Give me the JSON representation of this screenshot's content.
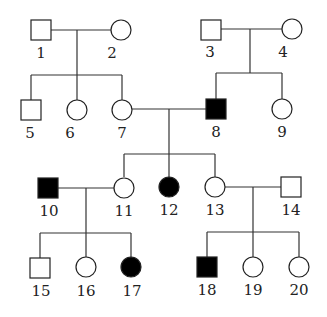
{
  "diagram": {
    "type": "pedigree",
    "colors": {
      "affected": "#000000",
      "unaffected": "#ffffff",
      "line": "#333333"
    },
    "individuals": [
      {
        "id": "1",
        "label": "1",
        "sex": "male",
        "affected": false,
        "generation": 1
      },
      {
        "id": "2",
        "label": "2",
        "sex": "female",
        "affected": false,
        "generation": 1
      },
      {
        "id": "3",
        "label": "3",
        "sex": "male",
        "affected": false,
        "generation": 1
      },
      {
        "id": "4",
        "label": "4",
        "sex": "female",
        "affected": false,
        "generation": 1
      },
      {
        "id": "5",
        "label": "5",
        "sex": "male",
        "affected": false,
        "generation": 2
      },
      {
        "id": "6",
        "label": "6",
        "sex": "female",
        "affected": false,
        "generation": 2
      },
      {
        "id": "7",
        "label": "7",
        "sex": "female",
        "affected": false,
        "generation": 2
      },
      {
        "id": "8",
        "label": "8",
        "sex": "male",
        "affected": true,
        "generation": 2
      },
      {
        "id": "9",
        "label": "9",
        "sex": "female",
        "affected": false,
        "generation": 2
      },
      {
        "id": "10",
        "label": "10",
        "sex": "male",
        "affected": true,
        "generation": 3
      },
      {
        "id": "11",
        "label": "11",
        "sex": "female",
        "affected": false,
        "generation": 3
      },
      {
        "id": "12",
        "label": "12",
        "sex": "female",
        "affected": true,
        "generation": 3
      },
      {
        "id": "13",
        "label": "13",
        "sex": "female",
        "affected": false,
        "generation": 3
      },
      {
        "id": "14",
        "label": "14",
        "sex": "male",
        "affected": false,
        "generation": 3
      },
      {
        "id": "15",
        "label": "15",
        "sex": "male",
        "affected": false,
        "generation": 4
      },
      {
        "id": "16",
        "label": "16",
        "sex": "female",
        "affected": false,
        "generation": 4
      },
      {
        "id": "17",
        "label": "17",
        "sex": "female",
        "affected": true,
        "generation": 4
      },
      {
        "id": "18",
        "label": "18",
        "sex": "male",
        "affected": true,
        "generation": 4
      },
      {
        "id": "19",
        "label": "19",
        "sex": "female",
        "affected": false,
        "generation": 4
      },
      {
        "id": "20",
        "label": "20",
        "sex": "female",
        "affected": false,
        "generation": 4
      }
    ],
    "matings": [
      {
        "partners": [
          "1",
          "2"
        ],
        "children": [
          "5",
          "6",
          "7"
        ]
      },
      {
        "partners": [
          "3",
          "4"
        ],
        "children": [
          "8",
          "9"
        ]
      },
      {
        "partners": [
          "7",
          "8"
        ],
        "children": [
          "11",
          "12",
          "13"
        ]
      },
      {
        "partners": [
          "10",
          "11"
        ],
        "children": [
          "15",
          "16",
          "17"
        ]
      },
      {
        "partners": [
          "13",
          "14"
        ],
        "children": [
          "18",
          "19",
          "20"
        ]
      }
    ]
  }
}
